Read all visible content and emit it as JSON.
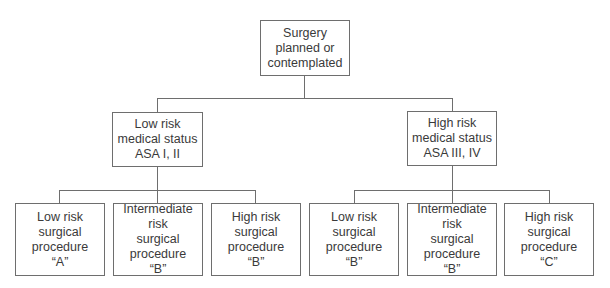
{
  "diagram": {
    "root": {
      "label": "Surgery\nplanned or\ncontemplated"
    },
    "medical_status": [
      {
        "label": "Low risk\nmedical status\nASA I, II",
        "procedures": [
          {
            "label": "Low risk\nsurgical\nprocedure\n“A”"
          },
          {
            "label": "Intermediate risk\nsurgical\nprocedure\n“B”"
          },
          {
            "label": "High risk\nsurgical\nprocedure\n“B”"
          }
        ]
      },
      {
        "label": "High risk\nmedical status\nASA III, IV",
        "procedures": [
          {
            "label": "Low risk\nsurgical\nprocedure\n“B”"
          },
          {
            "label": "Intermediate risk\nsurgical\nprocedure\n“B”"
          },
          {
            "label": "High risk\nsurgical\nprocedure\n“C”"
          }
        ]
      }
    ],
    "colors": {
      "line": "#6e6e6e",
      "text": "#3a3a3a",
      "background": "#ffffff"
    }
  }
}
